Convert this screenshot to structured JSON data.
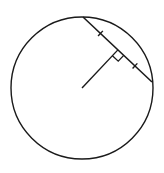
{
  "diagram": {
    "stroke_color": "#1a1a1a",
    "background": "#ffffff",
    "circle": {
      "cx": 82,
      "cy": 88,
      "r": 71
    },
    "chord": {
      "x1": 83,
      "y1": 17,
      "x2": 152,
      "y2": 82
    },
    "center": {
      "x": 82,
      "y": 88
    },
    "perpendicular_foot": {
      "x": 117.5,
      "y": 49.5
    },
    "right_angle_marker": {
      "size": 8
    },
    "tick_marks": [
      {
        "x": 100,
        "y": 33
      },
      {
        "x": 135,
        "y": 66
      }
    ]
  }
}
